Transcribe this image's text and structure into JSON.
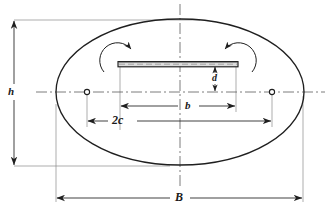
{
  "figure": {
    "kind": "engineering-dimension-diagram",
    "line_color": "#1f1f1f",
    "centerline_color": "#555555",
    "thin_line_color": "#777777",
    "background": "#ffffff"
  },
  "labels": {
    "height": "h",
    "crack_length": "b",
    "focal_distance": "2c",
    "offset": "d",
    "width": "B"
  },
  "geometry": {
    "ellipse": {
      "cx": 180,
      "cy": 92,
      "rx": 124,
      "ry": 73
    },
    "slot": {
      "x1": 118,
      "x2": 238,
      "y": 64,
      "thickness": 5
    },
    "foci": [
      {
        "x": 87,
        "y": 92,
        "r": 2.6
      },
      {
        "x": 272,
        "y": 92,
        "r": 2.6
      }
    ],
    "dimension_h": {
      "x": 14,
      "y1": 20,
      "y2": 166
    },
    "dimension_b": {
      "y": 106,
      "x1": 120,
      "x2": 236
    },
    "dimension_2c": {
      "y": 121,
      "x1": 87,
      "x2": 272
    },
    "dimension_d": {
      "x": 215,
      "y1": 64,
      "y2": 92
    },
    "dimension_B": {
      "y": 198,
      "x1": 56,
      "x2": 303
    }
  },
  "icon_names": {
    "rotation_left": "rotation-arrow-ccw-icon",
    "rotation_right": "rotation-arrow-cw-icon",
    "focus_marker": "focus-point-icon"
  }
}
